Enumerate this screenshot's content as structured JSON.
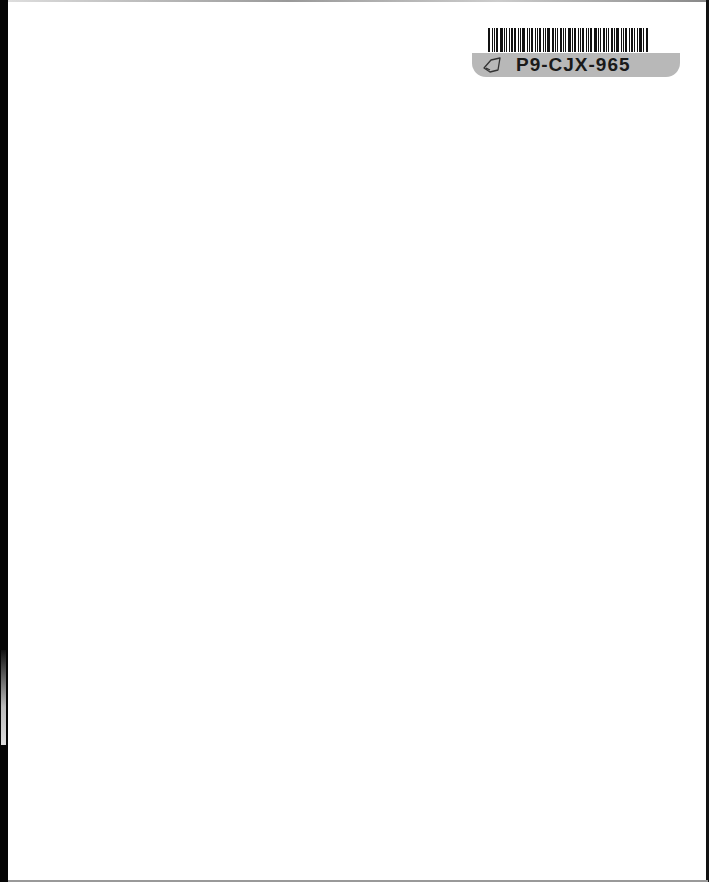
{
  "page": {
    "type": "scanned blank page",
    "background": "#ffffff"
  },
  "barcode_label": {
    "code": "P9-CJX-965",
    "icon": "tag-icon",
    "strip_color": "#b8b8b8"
  }
}
